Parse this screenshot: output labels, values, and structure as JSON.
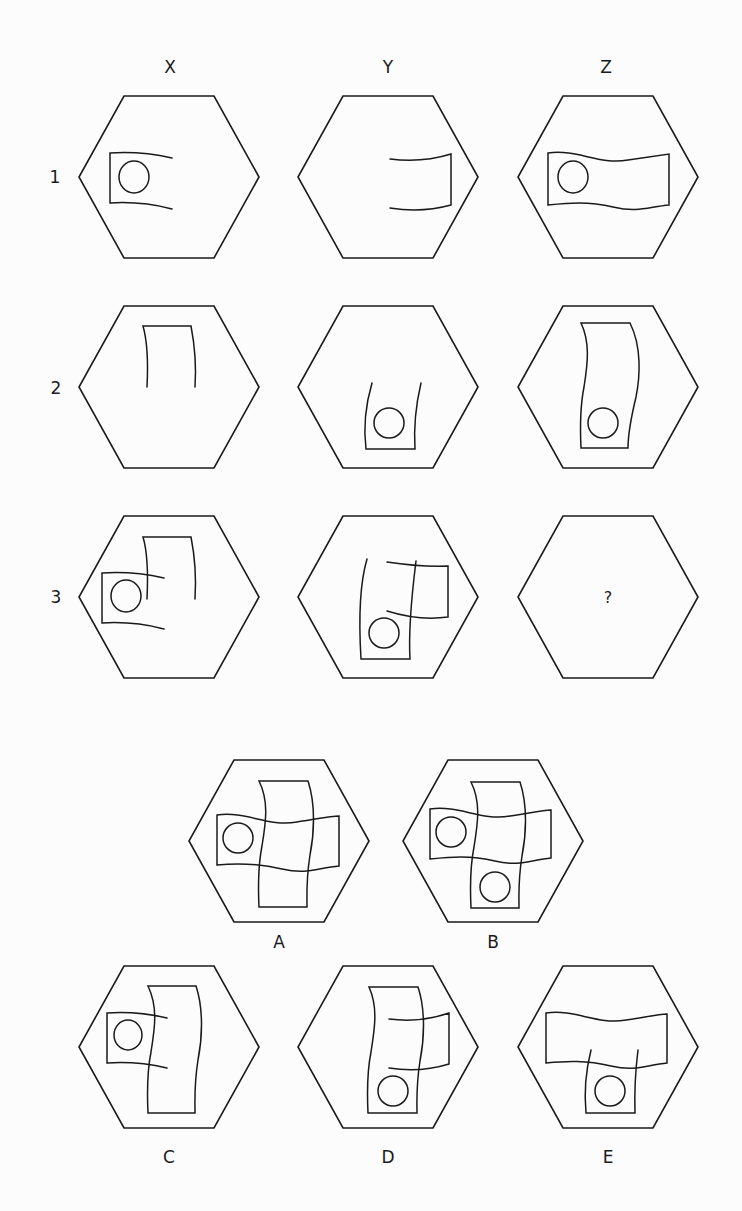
{
  "puzzle": {
    "column_labels": [
      {
        "text": "X",
        "x": 170,
        "y": 67
      },
      {
        "text": "Y",
        "x": 388,
        "y": 67
      },
      {
        "text": "Z",
        "x": 606,
        "y": 67
      }
    ],
    "row_labels": [
      {
        "text": "1",
        "x": 55,
        "y": 177
      },
      {
        "text": "2",
        "x": 56,
        "y": 388
      },
      {
        "text": "3",
        "x": 56,
        "y": 597
      }
    ],
    "question_mark": "?",
    "hex": {
      "half_width": 90,
      "half_height": 81,
      "top_half_width": 45
    },
    "grid_cells": [
      {
        "id": "X1",
        "cx": 169,
        "cy": 177,
        "paths": [
          "M 3 -19 Q -28 -26 -59 -24 L -59 26 Q -28 24 3 32"
        ],
        "circles": [
          {
            "x": -35,
            "y": 0,
            "rx": 15,
            "ry": 16
          }
        ]
      },
      {
        "id": "Y1",
        "cx": 388,
        "cy": 177,
        "paths": [
          "M 2 -18 Q 34 -14 63 -23 L 63 28 Q 34 36 2 31"
        ],
        "circles": []
      },
      {
        "id": "Z1",
        "cx": 608,
        "cy": 177,
        "paths": [
          "M -60 -24 C -30 -28 -10 -12 20 -17 C 40 -20 55 -22 61 -23 L 61 28 C 40 30 30 36 5 30 C -20 24 -40 26 -60 28 Z"
        ],
        "circles": [
          {
            "x": -35,
            "y": 0,
            "rx": 15,
            "ry": 16
          }
        ]
      },
      {
        "id": "X2",
        "cx": 169,
        "cy": 387,
        "paths": [
          "M -22 0 Q -20 -40 -26 -61 L 22 -61 Q 28 -30 26 0"
        ],
        "circles": []
      },
      {
        "id": "Y2",
        "cx": 388,
        "cy": 387,
        "paths": [
          "M -16 -4 Q -26 30 -22 62 L 27 62 Q 25 30 33 -4"
        ],
        "circles": [
          {
            "x": 1,
            "y": 36,
            "rx": 15,
            "ry": 15
          }
        ]
      },
      {
        "id": "Z2",
        "cx": 608,
        "cy": 387,
        "paths": [
          "M -27 -64 L 22 -64 C 34 -40 32 -10 28 10 C 22 35 20 50 20 61 L -27 61 C -28 40 -28 20 -24 0 C -20 -25 -18 -45 -27 -64 Z"
        ],
        "circles": [
          {
            "x": -5,
            "y": 36,
            "rx": 15,
            "ry": 15
          }
        ]
      },
      {
        "id": "X3",
        "cx": 169,
        "cy": 597,
        "paths": [
          "M -5 -19 Q -36 -26 -67 -24 L -67 26 Q -36 24 -5 32",
          "M -22 2 Q -20 -40 -26 -60 L 22 -60 Q 28 -30 26 2"
        ],
        "circles": [
          {
            "x": -43,
            "y": -1,
            "rx": 15,
            "ry": 16
          }
        ]
      },
      {
        "id": "Y3",
        "cx": 388,
        "cy": 597,
        "paths": [
          "M -1 -35 Q 31 -30 60 -31 L 60 20 Q 31 24 -1 14",
          "M -21 -38 Q -31 -4 -27 62 L 22 62 Q 20 28 28 -36"
        ],
        "circles": [
          {
            "x": -4,
            "y": 36,
            "rx": 15,
            "ry": 15
          }
        ]
      },
      {
        "id": "Z3",
        "cx": 608,
        "cy": 597,
        "paths": [],
        "circles": [],
        "question": true
      }
    ],
    "options": [
      {
        "label": "A",
        "cx": 279,
        "cy": 841,
        "label_y": 942,
        "paths": [
          "M -62 -26 C -32 -30 -12 -14 18 -19 C 38 -22 52 -25 60 -25 L 60 25 C 38 27 28 34 3 28 C -22 22 -42 22 -62 24 Z",
          "M -20 -60 L 29 -60 C 37 -36 35 -6 31 14 C 27 39 28 54 28 66 L -20 66 C -21 45 -21 25 -17 5 C -13 -20 -10 -40 -20 -60 Z"
        ],
        "circles": [
          {
            "x": -41,
            "y": -3,
            "rx": 15,
            "ry": 15
          }
        ]
      },
      {
        "label": "B",
        "cx": 493,
        "cy": 841,
        "label_y": 942,
        "paths": [
          "M -63 -32 C -33 -36 -13 -20 17 -25 C 37 -28 50 -31 58 -31 L 58 17 C 37 19 27 26 2 20 C -23 14 -43 16 -63 18 Z",
          "M -22 -59 L 27 -59 C 35 -35 33 -5 29 15 C 25 40 26 55 26 67 L -22 67 C -23 46 -23 26 -19 6 C -15 -19 -12 -39 -22 -59 Z"
        ],
        "circles": [
          {
            "x": -42,
            "y": -9,
            "rx": 15,
            "ry": 15
          },
          {
            "x": 2,
            "y": 46,
            "rx": 15,
            "ry": 15
          }
        ]
      },
      {
        "label": "C",
        "cx": 169,
        "cy": 1047,
        "label_y": 1157,
        "paths": [
          "M -2 -29 Q -32 -36 -62 -34 L -62 16 Q -32 14 -2 21",
          "M -21 -61 L 27 -61 C 35 -37 33 -7 29 13 C 25 38 26 53 26 66 L -21 66 C -22 45 -22 25 -18 5 C -14 -20 -11 -40 -21 -61 Z"
        ],
        "circles": [
          {
            "x": -41,
            "y": -12,
            "rx": 14,
            "ry": 15
          }
        ]
      },
      {
        "label": "D",
        "cx": 388,
        "cy": 1047,
        "label_y": 1157,
        "paths": [
          "M -19 -60 L 30 -60 C 38 -36 36 -6 32 14 C 28 39 29 54 29 66 L -20 66 C -21 45 -21 25 -17 5 C -13 -20 -10 -40 -19 -60 Z",
          "M 1 -28 Q 32 -24 61 -34 L 61 17 Q 32 26 1 21"
        ],
        "circles": [
          {
            "x": 5,
            "y": 44,
            "rx": 15,
            "ry": 15
          }
        ]
      },
      {
        "label": "E",
        "cx": 608,
        "cy": 1047,
        "label_y": 1157,
        "paths": [
          "M -62 -34 C -32 -38 -12 -22 18 -27 C 38 -30 51 -33 59 -33 L 59 16 C 38 18 28 25 3 19 C -22 13 -42 14 -62 16 Z",
          "M -17 3 Q -25 35 -22 66 L 27 66 Q 26 35 30 3"
        ],
        "circles": [
          {
            "x": 2,
            "y": 44,
            "rx": 15,
            "ry": 15
          }
        ]
      }
    ]
  }
}
